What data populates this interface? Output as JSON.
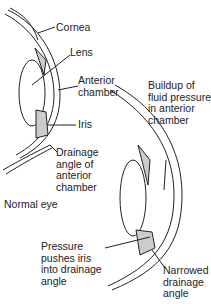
{
  "normal_eye": {
    "caption": "Normal eye",
    "labels": {
      "cornea": "Cornea",
      "lens": "Lens",
      "anterior_chamber": [
        "Anterior",
        "chamber"
      ],
      "iris": "Iris",
      "drainage_angle": [
        "Drainage",
        "angle of",
        "anterior",
        "chamber"
      ]
    }
  },
  "glaucoma_eye": {
    "labels": {
      "buildup": [
        "Buildup of",
        "fluid pressure",
        "in anterior",
        "chamber"
      ],
      "pressure": [
        "Pressure",
        "pushes iris",
        "into drainage",
        "angle"
      ],
      "narrowed": [
        "Narrowed",
        "drainage",
        "angle"
      ]
    }
  },
  "colors": {
    "line": "#222222",
    "tissue": "#cccccc",
    "background": "#ffffff"
  }
}
